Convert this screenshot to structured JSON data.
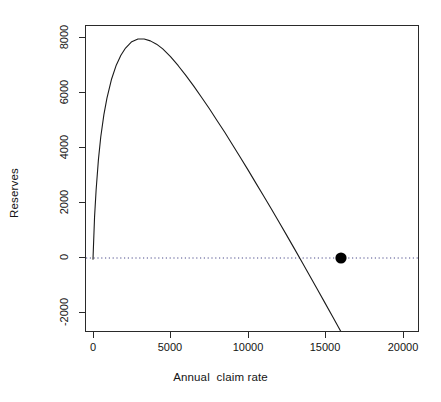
{
  "chart_data": {
    "type": "line",
    "title": "",
    "xlabel": "Annual  claim rate",
    "ylabel": "Reserves",
    "xlim": [
      -950,
      21000
    ],
    "ylim": [
      -2950,
      8700
    ],
    "xticks": [
      0,
      5000,
      10000,
      15000,
      20000
    ],
    "xtick_labels": [
      "0",
      "5000",
      "10000",
      "15000",
      "20000"
    ],
    "yticks": [
      -2000,
      0,
      2000,
      4000,
      6000,
      8000
    ],
    "ytick_labels": [
      "-2000",
      "0",
      "2000",
      "4000",
      "6000",
      "8000"
    ],
    "grid": false,
    "legend": null,
    "series": [
      {
        "name": "reserves-curve",
        "type": "line",
        "color": "#1a1a1a",
        "linewidth": 1,
        "x": [
          0,
          100,
          200,
          350,
          500,
          700,
          900,
          1200,
          1500,
          1800,
          2100,
          2500,
          2900,
          3300,
          3700,
          4100,
          4500,
          5000,
          5500,
          6000,
          6500,
          7000,
          7500,
          8000,
          8500,
          9000,
          9500,
          10000,
          10500,
          11000,
          11500,
          12000,
          12500,
          13000,
          13500,
          14000,
          14500,
          15000,
          15500,
          16000,
          16500,
          17000,
          17500,
          18000
        ],
        "y": [
          -40,
          1480,
          2450,
          3560,
          4380,
          5180,
          5790,
          6480,
          6980,
          7340,
          7600,
          7830,
          7930,
          7930,
          7860,
          7740,
          7570,
          7290,
          6960,
          6600,
          6220,
          5820,
          5410,
          4980,
          4550,
          4100,
          3650,
          3190,
          2720,
          2250,
          1780,
          1300,
          820,
          330,
          -160,
          -660,
          -1160,
          -1660,
          -2160,
          -2670,
          -3180,
          -3690,
          -4200,
          -4710
        ]
      }
    ],
    "reference_line": {
      "name": "zero-line",
      "orientation": "horizontal",
      "y": 0,
      "style": "dotted",
      "color": "#4a4a8a"
    },
    "points": [
      {
        "name": "break-even-point",
        "x": 16000,
        "y": 0,
        "marker": "filled-circle",
        "color": "#000000",
        "size": 6
      }
    ]
  },
  "axes": {
    "box": true,
    "box_color": "#2a2a2a"
  }
}
